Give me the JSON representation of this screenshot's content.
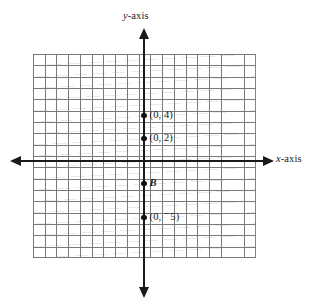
{
  "figure": {
    "kind": "coordinate-plane-diagram",
    "background_color": "#ffffff",
    "ink_color": "#1a1a1a",
    "grid_color": "#6f6f6f"
  },
  "axes": {
    "y": {
      "label": "y-axis",
      "label_variable": "y",
      "label_suffix": "-axis",
      "orientation": "vertical",
      "arrow_top": "arrow-up",
      "arrow_bottom": "arrow-down"
    },
    "x": {
      "label": "x-axis",
      "label_variable": "x",
      "label_suffix": "-axis",
      "orientation": "horizontal",
      "arrow_left": "arrow-left",
      "arrow_right": "arrow-right"
    }
  },
  "grid": {
    "columns": 19,
    "rows": 18,
    "cell_width_px": 11.74,
    "cell_height_px": 11.34
  },
  "chart_data": {
    "type": "scatter",
    "title": "",
    "xlabel": "x-axis",
    "ylabel": "y-axis",
    "grid": true,
    "legend": "none",
    "units_per_cell": 1,
    "points": [
      {
        "label": "(0, 4)",
        "x": 0,
        "y": 4,
        "label_position": "right"
      },
      {
        "label": "(0, 2)",
        "x": 0,
        "y": 2,
        "label_position": "right"
      },
      {
        "label": "B",
        "x": 0,
        "y": -2,
        "label_position": "right",
        "style": "italic"
      },
      {
        "label": "(0, ⁻5)",
        "x": 0,
        "y": -5,
        "label_position": "right",
        "label_prefix": "(0, ",
        "label_negative": "−",
        "label_value": "5",
        "label_suffix": ")"
      }
    ]
  }
}
